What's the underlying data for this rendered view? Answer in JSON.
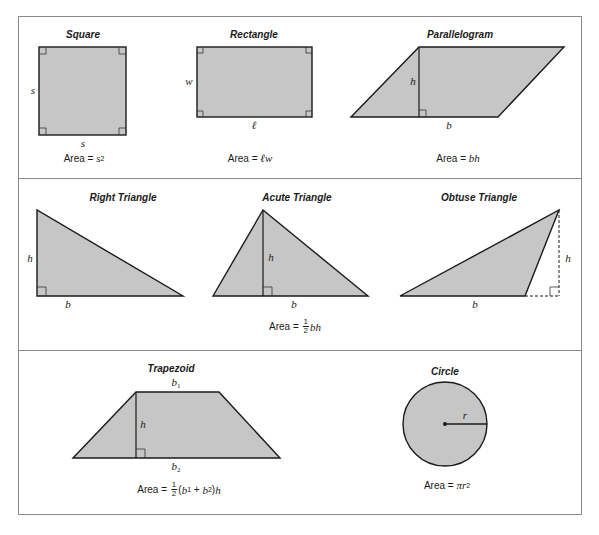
{
  "colors": {
    "fill": "#c6c6c6",
    "stroke": "#1a1a1a",
    "frame": "#8a8a8a",
    "text": "#1a1a1a"
  },
  "rows": [
    {
      "shapes": [
        {
          "name": "square",
          "title": "Square",
          "labels": {
            "side_left": "s",
            "side_bottom": "s"
          },
          "formula": {
            "prefix": "Area = ",
            "var": "s",
            "exp": "2"
          }
        },
        {
          "name": "rectangle",
          "title": "Rectangle",
          "labels": {
            "width": "w",
            "length": "ℓ"
          },
          "formula": {
            "prefix": "Area = ",
            "var": "ℓw"
          }
        },
        {
          "name": "parallelogram",
          "title": "Parallelogram",
          "labels": {
            "height": "h",
            "base": "b"
          },
          "formula": {
            "prefix": "Area = ",
            "var": "bh"
          }
        }
      ]
    },
    {
      "shapes": [
        {
          "name": "right-triangle",
          "title": "Right Triangle",
          "labels": {
            "height": "h",
            "base": "b"
          }
        },
        {
          "name": "acute-triangle",
          "title": "Acute Triangle",
          "labels": {
            "height": "h",
            "base": "b"
          }
        },
        {
          "name": "obtuse-triangle",
          "title": "Obtuse Triangle",
          "labels": {
            "height": "h",
            "base": "b"
          }
        }
      ],
      "formula": {
        "prefix": "Area = ",
        "frac_num": "1",
        "frac_den": "2",
        "var": "bh"
      }
    },
    {
      "shapes": [
        {
          "name": "trapezoid",
          "title": "Trapezoid",
          "labels": {
            "top_base": "b",
            "top_base_sub": "1",
            "height": "h",
            "bottom_base": "b",
            "bottom_base_sub": "2"
          },
          "formula": {
            "prefix": "Area = ",
            "frac_num": "1",
            "frac_den": "2",
            "open": "(",
            "b1": "b",
            "b1_sub": "1",
            "plus": " + ",
            "b2": "b",
            "b2_sub": "2",
            "close": ")",
            "h": "h"
          }
        },
        {
          "name": "circle",
          "title": "Circle",
          "labels": {
            "radius": "r"
          },
          "formula": {
            "prefix": "Area = ",
            "var": "πr",
            "exp": "2"
          }
        }
      ]
    }
  ]
}
